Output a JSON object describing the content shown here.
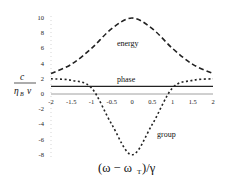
{
  "chart_data": {
    "type": "line",
    "title": "",
    "xlabel": "(ω − ω_T)/γ",
    "ylabel": "c / (η_B v)",
    "xlim": [
      -2,
      2
    ],
    "ylim": [
      -8,
      10
    ],
    "grid": false,
    "legend": "inline labels",
    "x_ticks": [
      "-2",
      "-1.5",
      "-1",
      "-0.5",
      "0",
      "0.5",
      "1",
      "1.5",
      "2"
    ],
    "y_ticks": [
      "10",
      "8",
      "6",
      "4",
      "2",
      "0",
      "-2",
      "-4",
      "-6",
      "-8"
    ],
    "x": [
      -2,
      -1.5,
      -1,
      -0.5,
      0,
      0.5,
      1,
      1.5,
      2
    ],
    "series": [
      {
        "name": "energy",
        "style": "long-dashed",
        "values": [
          2.7,
          3.9,
          6.0,
          8.6,
          10.0,
          8.6,
          6.0,
          3.9,
          2.7
        ]
      },
      {
        "name": "phase",
        "style": "solid",
        "values": [
          1.0,
          1.0,
          1.0,
          1.0,
          1.0,
          1.0,
          1.0,
          1.0,
          1.0
        ]
      },
      {
        "name": "group",
        "style": "short-dashed",
        "values": [
          2.0,
          1.8,
          0.8,
          -4.0,
          -8.0,
          -4.0,
          0.8,
          1.8,
          2.0
        ]
      }
    ],
    "annotations": [
      "energy",
      "phase",
      "group"
    ]
  },
  "labels": {
    "ylabel_num": "c",
    "ylabel_den_eta": "η",
    "ylabel_den_sub": "B",
    "ylabel_den_v": "v",
    "xlabel": "(ω − ω",
    "xlabel_sub": "T",
    "xlabel_tail": ")/γ",
    "energy": "energy",
    "phase": "phase",
    "group": "group"
  }
}
